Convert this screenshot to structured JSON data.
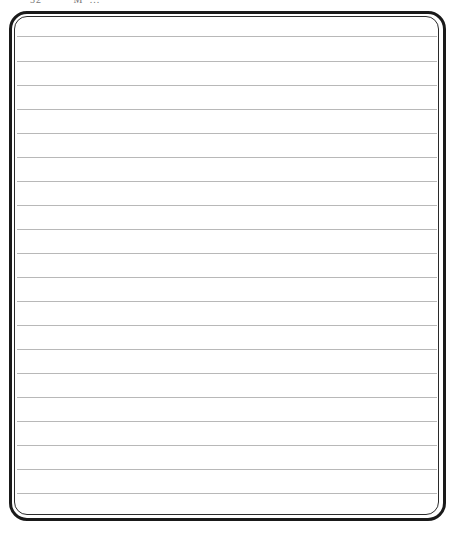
{
  "header": {
    "page_number": "32",
    "running_title": "M' ..."
  },
  "page": {
    "type": "lined-writing-page",
    "rule_count": 20,
    "rule_color": "#b8b8b8",
    "border_color": "#1a1a1a",
    "rules_y": [
      36,
      61,
      85,
      109,
      133,
      157,
      181,
      205,
      229,
      253,
      277,
      301,
      325,
      349,
      373,
      397,
      421,
      445,
      469,
      493
    ]
  }
}
